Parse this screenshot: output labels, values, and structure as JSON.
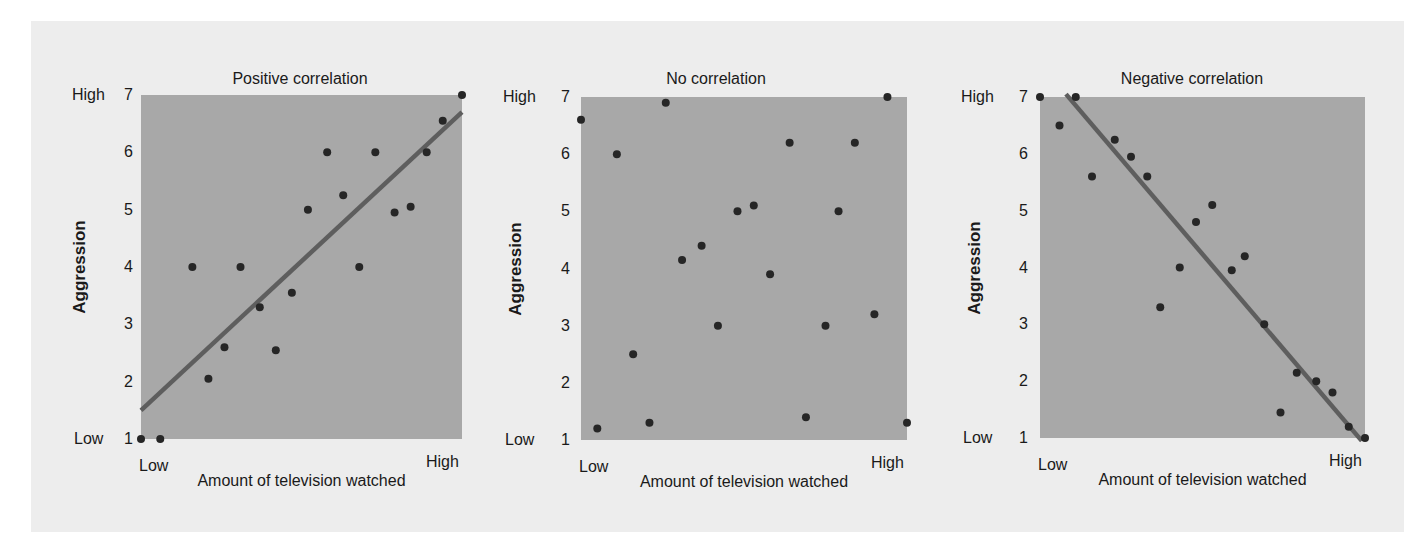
{
  "chart_data": [
    {
      "type": "scatter",
      "title": "Positive correlation",
      "xlabel": "Amount of television watched",
      "ylabel": "Aggression",
      "x_tick_labels": [
        "Low",
        "High"
      ],
      "y_ticks": [
        1,
        2,
        3,
        4,
        5,
        6,
        7
      ],
      "y_level_labels": {
        "low": "Low",
        "high": "High"
      },
      "xlim": [
        0,
        10
      ],
      "ylim": [
        1,
        7
      ],
      "grid": false,
      "points": [
        [
          0.0,
          1.0
        ],
        [
          0.6,
          1.0
        ],
        [
          1.6,
          4.0
        ],
        [
          2.1,
          2.05
        ],
        [
          2.6,
          2.6
        ],
        [
          3.1,
          4.0
        ],
        [
          3.7,
          3.3
        ],
        [
          4.2,
          2.55
        ],
        [
          4.7,
          3.55
        ],
        [
          5.2,
          5.0
        ],
        [
          5.8,
          6.0
        ],
        [
          6.3,
          5.25
        ],
        [
          6.8,
          4.0
        ],
        [
          7.3,
          6.0
        ],
        [
          7.9,
          4.95
        ],
        [
          8.4,
          5.05
        ],
        [
          8.9,
          6.0
        ],
        [
          9.4,
          6.55
        ],
        [
          10.0,
          7.0
        ]
      ],
      "trend_line": [
        [
          0.0,
          1.5
        ],
        [
          10.0,
          6.7
        ]
      ]
    },
    {
      "type": "scatter",
      "title": "No correlation",
      "xlabel": "Amount of television watched",
      "ylabel": "Aggression",
      "x_tick_labels": [
        "Low",
        "High"
      ],
      "y_ticks": [
        1,
        2,
        3,
        4,
        5,
        6,
        7
      ],
      "y_level_labels": {
        "low": "Low",
        "high": "High"
      },
      "xlim": [
        0,
        10
      ],
      "ylim": [
        1,
        7
      ],
      "grid": false,
      "points": [
        [
          0.0,
          6.6
        ],
        [
          0.5,
          1.2
        ],
        [
          1.1,
          6.0
        ],
        [
          1.6,
          2.5
        ],
        [
          2.1,
          1.3
        ],
        [
          2.6,
          6.9
        ],
        [
          3.1,
          4.15
        ],
        [
          3.7,
          4.4
        ],
        [
          4.2,
          3.0
        ],
        [
          4.8,
          5.0
        ],
        [
          5.3,
          5.1
        ],
        [
          5.8,
          3.9
        ],
        [
          6.4,
          6.2
        ],
        [
          6.9,
          1.4
        ],
        [
          7.5,
          3.0
        ],
        [
          7.9,
          5.0
        ],
        [
          8.4,
          6.2
        ],
        [
          9.0,
          3.2
        ],
        [
          9.4,
          7.0
        ],
        [
          10.0,
          1.3
        ]
      ],
      "trend_line": null
    },
    {
      "type": "scatter",
      "title": "Negative correlation",
      "xlabel": "Amount of television watched",
      "ylabel": "Aggression",
      "x_tick_labels": [
        "Low",
        "High"
      ],
      "y_ticks": [
        1,
        2,
        3,
        4,
        5,
        6,
        7
      ],
      "y_level_labels": {
        "low": "Low",
        "high": "High"
      },
      "xlim": [
        0,
        10
      ],
      "ylim": [
        1,
        7
      ],
      "grid": false,
      "points": [
        [
          0.0,
          7.0
        ],
        [
          0.6,
          6.5
        ],
        [
          1.1,
          7.0
        ],
        [
          1.6,
          5.6
        ],
        [
          2.3,
          6.25
        ],
        [
          2.8,
          5.95
        ],
        [
          3.3,
          5.6
        ],
        [
          3.7,
          3.3
        ],
        [
          4.3,
          4.0
        ],
        [
          4.8,
          4.8
        ],
        [
          5.3,
          5.1
        ],
        [
          5.9,
          3.95
        ],
        [
          6.3,
          4.2
        ],
        [
          6.9,
          3.0
        ],
        [
          7.4,
          1.45
        ],
        [
          7.9,
          2.15
        ],
        [
          8.5,
          2.0
        ],
        [
          9.0,
          1.8
        ],
        [
          9.5,
          1.2
        ],
        [
          10.0,
          1.0
        ]
      ],
      "trend_line": [
        [
          0.8,
          7.05
        ],
        [
          9.9,
          0.95
        ]
      ]
    }
  ],
  "style": {
    "panel_bg": "#ededed",
    "plot_bg": "#a8a8a8",
    "point_color": "#262626",
    "line_color": "#5e5e5e",
    "text_color": "#1a1a1a"
  }
}
